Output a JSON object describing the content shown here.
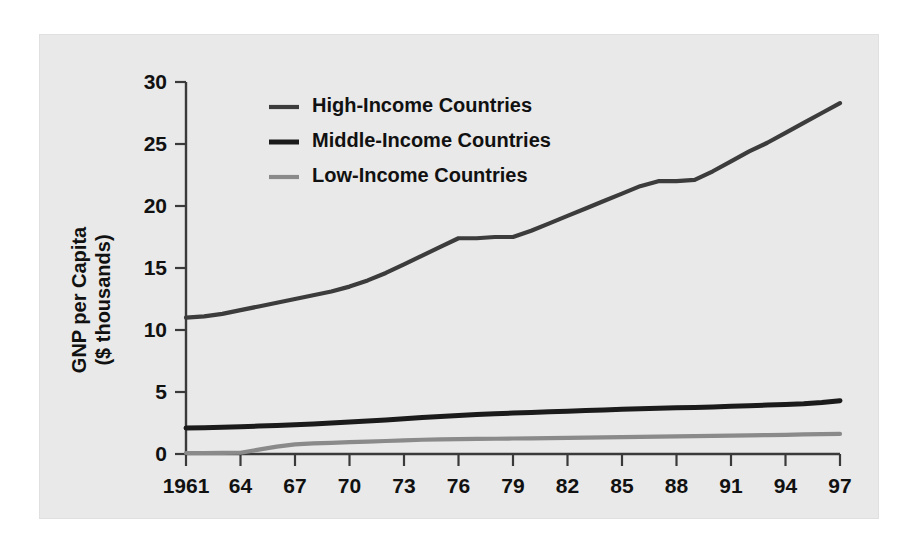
{
  "figure": {
    "panel_background": "#e9e9e9",
    "page_background": "#ffffff"
  },
  "axes": {
    "y_title_line1": "GNP per Capita",
    "y_title_line2": "($ thousands)",
    "x_title": "",
    "y_ticks": [
      "0",
      "5",
      "10",
      "15",
      "20",
      "25",
      "30"
    ],
    "x_ticks": [
      "1961",
      "64",
      "67",
      "70",
      "73",
      "76",
      "79",
      "82",
      "85",
      "88",
      "91",
      "94",
      "97"
    ]
  },
  "legend": {
    "position": "inside-upper-left",
    "items": [
      {
        "label": "High-Income Countries",
        "color": "#3c3c3c",
        "width": 4.2
      },
      {
        "label": "Middle-Income Countries",
        "color": "#1b1b1b",
        "width": 5.0
      },
      {
        "label": "Low-Income Countries",
        "color": "#8a8a8a",
        "width": 4.2
      }
    ]
  },
  "chart_data": {
    "type": "line",
    "title": "",
    "xlabel": "",
    "ylabel": "GNP per Capita ($ thousands)",
    "xlim": [
      1961,
      1997
    ],
    "ylim": [
      0,
      30
    ],
    "ytick_values": [
      0,
      5,
      10,
      15,
      20,
      25,
      30
    ],
    "xtick_values": [
      1961,
      1964,
      1967,
      1970,
      1973,
      1976,
      1979,
      1982,
      1985,
      1988,
      1991,
      1994,
      1997
    ],
    "xtick_labels": [
      "1961",
      "64",
      "67",
      "70",
      "73",
      "76",
      "79",
      "82",
      "85",
      "88",
      "91",
      "94",
      "97"
    ],
    "grid": false,
    "legend_position": "upper left (inside axes)",
    "x": [
      1961,
      1962,
      1963,
      1964,
      1965,
      1966,
      1967,
      1968,
      1969,
      1970,
      1971,
      1972,
      1973,
      1974,
      1975,
      1976,
      1977,
      1978,
      1979,
      1980,
      1981,
      1982,
      1983,
      1984,
      1985,
      1986,
      1987,
      1988,
      1989,
      1990,
      1991,
      1992,
      1993,
      1994,
      1995,
      1996,
      1997
    ],
    "series": [
      {
        "name": "High-Income Countries",
        "color": "#3c3c3c",
        "values": [
          11.0,
          11.1,
          11.3,
          11.6,
          11.9,
          12.2,
          12.5,
          12.8,
          13.1,
          13.5,
          14.0,
          14.6,
          15.3,
          16.0,
          16.7,
          17.4,
          17.4,
          17.5,
          17.5,
          18.0,
          18.6,
          19.2,
          19.8,
          20.4,
          21.0,
          21.6,
          22.0,
          22.0,
          22.1,
          22.8,
          23.6,
          24.4,
          25.1,
          25.9,
          26.7,
          27.5,
          28.3
        ]
      },
      {
        "name": "Middle-Income Countries",
        "color": "#1b1b1b",
        "values": [
          2.1,
          2.12,
          2.15,
          2.2,
          2.25,
          2.3,
          2.35,
          2.42,
          2.5,
          2.58,
          2.66,
          2.75,
          2.85,
          2.95,
          3.02,
          3.1,
          3.18,
          3.25,
          3.3,
          3.35,
          3.4,
          3.45,
          3.5,
          3.55,
          3.6,
          3.64,
          3.68,
          3.72,
          3.76,
          3.8,
          3.85,
          3.9,
          3.95,
          4.0,
          4.05,
          4.15,
          4.3
        ]
      },
      {
        "name": "Low-Income Countries",
        "color": "#8a8a8a",
        "values": [
          0.08,
          0.08,
          0.09,
          0.1,
          0.35,
          0.6,
          0.78,
          0.85,
          0.9,
          0.95,
          1.0,
          1.05,
          1.1,
          1.15,
          1.18,
          1.2,
          1.22,
          1.23,
          1.25,
          1.26,
          1.28,
          1.3,
          1.32,
          1.34,
          1.36,
          1.38,
          1.4,
          1.42,
          1.44,
          1.46,
          1.48,
          1.5,
          1.52,
          1.55,
          1.58,
          1.6,
          1.62
        ]
      }
    ]
  }
}
